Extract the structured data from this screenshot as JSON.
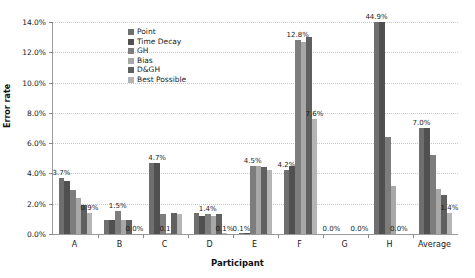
{
  "chart_data": {
    "type": "bar",
    "title": "",
    "subtitle": "",
    "xlabel": "Participant",
    "ylabel": "Error rate",
    "categories": [
      "A",
      "B",
      "C",
      "D",
      "E",
      "F",
      "G",
      "H",
      "Average"
    ],
    "ylim": [
      0,
      14
    ],
    "y_ticks": [
      "0.0%",
      "2.0%",
      "4.0%",
      "6.0%",
      "8.0%",
      "10.0%",
      "12.0%",
      "14.0%"
    ],
    "y_tick_values": [
      0,
      2,
      4,
      6,
      8,
      10,
      12,
      14
    ],
    "y_unit": "%",
    "grid": "horizontal-dotted",
    "legend_position": "inside-top-left",
    "series": [
      {
        "name": "Point",
        "color": "#6f6f6f",
        "values": [
          3.7,
          0.9,
          4.7,
          1.4,
          0.1,
          4.2,
          0.0,
          44.9,
          7.0
        ]
      },
      {
        "name": "Time Decay",
        "color": "#505050",
        "values": [
          3.5,
          0.9,
          4.7,
          1.2,
          0.1,
          4.5,
          0.0,
          44.9,
          7.0
        ]
      },
      {
        "name": "GH",
        "color": "#7d7d7d",
        "values": [
          2.9,
          1.5,
          1.3,
          1.3,
          4.5,
          12.8,
          0.0,
          6.4,
          5.2
        ]
      },
      {
        "name": "Bias",
        "color": "#a8a8a8",
        "values": [
          2.4,
          0.9,
          0.1,
          1.2,
          4.5,
          12.7,
          0.0,
          3.2,
          3.0
        ]
      },
      {
        "name": "D&GH",
        "color": "#606060",
        "values": [
          1.9,
          0.9,
          1.4,
          1.3,
          4.4,
          13.0,
          0.0,
          0.0,
          2.6
        ]
      },
      {
        "name": "Best Possible",
        "color": "#b5b5b5",
        "values": [
          1.4,
          0.0,
          1.3,
          0.1,
          4.2,
          7.6,
          0.0,
          0.0,
          1.4
        ]
      }
    ],
    "annotations": [
      {
        "text": "3.7%",
        "group": "A",
        "series": "Point"
      },
      {
        "text": "0.9%",
        "group": "A",
        "series": "Best Possible"
      },
      {
        "text": "1.5%",
        "group": "B",
        "series": "GH"
      },
      {
        "text": "0.0%",
        "group": "B",
        "series": "Best Possible"
      },
      {
        "text": "4.7%",
        "group": "C",
        "series": "Time Decay"
      },
      {
        "text": "0.1%",
        "group": "C",
        "series": "Bias"
      },
      {
        "text": "1.4%",
        "group": "D",
        "series": "GH"
      },
      {
        "text": "0.1%",
        "group": "D",
        "series": "Best Possible"
      },
      {
        "text": "4.5%",
        "group": "E",
        "series": "GH"
      },
      {
        "text": "0.1%",
        "group": "E",
        "series": "Point"
      },
      {
        "text": "12.8%",
        "group": "F",
        "series": "GH"
      },
      {
        "text": "4.2%",
        "group": "F",
        "series": "Point"
      },
      {
        "text": "7.6%",
        "group": "F",
        "series": "Best Possible"
      },
      {
        "text": "0.0%",
        "group": "G",
        "series": "Point"
      },
      {
        "text": "0.0%",
        "group": "G",
        "series": "Best Possible"
      },
      {
        "text": "44.9%",
        "group": "H",
        "series": "Point"
      },
      {
        "text": "0.0%",
        "group": "H",
        "series": "D&GH"
      },
      {
        "text": "7.0%",
        "group": "Average",
        "series": "Point"
      },
      {
        "text": "1.4%",
        "group": "Average",
        "series": "Best Possible"
      }
    ]
  },
  "legend": {
    "items": [
      {
        "label": "Point"
      },
      {
        "label": "Time Decay"
      },
      {
        "label": "GH"
      },
      {
        "label": "Bias"
      },
      {
        "label": "D&GH"
      },
      {
        "label": "Best Possible"
      }
    ]
  },
  "labels": {
    "a_point": "3.7%",
    "a_best": "0.9%",
    "b_gh": "1.5%",
    "b_best": "0.0%",
    "c_time": "4.7%",
    "c_bias": "0.1%",
    "d_gh": "1.4%",
    "d_best": "0.1%",
    "e_gh": "4.5%",
    "e_point": "0.1%",
    "f_gh": "12.8%",
    "f_point": "4.2%",
    "f_best": "7.6%",
    "g_point": "0.0%",
    "g_best": "0.0%",
    "h_point": "44.9%",
    "h_dgh": "0.0%",
    "avg_point": "7.0%",
    "avg_best": "1.4%"
  }
}
